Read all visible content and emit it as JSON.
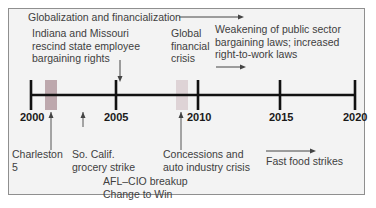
{
  "diagram": {
    "type": "timeline",
    "axis": {
      "start": 2000,
      "end": 2020,
      "ticks": [
        {
          "year": "2000"
        },
        {
          "year": "2005"
        },
        {
          "year": "2010"
        },
        {
          "year": "2015"
        },
        {
          "year": "2020"
        }
      ]
    },
    "periods": [
      {
        "label": "Globalization and financialization",
        "direction": "right-arrow"
      },
      {
        "label": "Weakening of public sector bargaining laws; increased right-to-work laws",
        "direction": "right-arrow"
      },
      {
        "label": "Fast food strikes",
        "direction": "right-arrow"
      }
    ],
    "above_events": [
      {
        "lines": [
          "Indiana and Missouri",
          "rescind state employee",
          "bargaining rights"
        ]
      },
      {
        "lines": [
          "Global",
          "financial",
          "crisis"
        ]
      },
      {
        "lines": [
          "Weakening of public sector",
          "bargaining laws; increased",
          "right-to-work laws"
        ]
      }
    ],
    "below_events": [
      {
        "lines": [
          "Charleston",
          "5"
        ]
      },
      {
        "lines": [
          "So. Calif.",
          "grocery strike"
        ]
      },
      {
        "lines": [
          "Concessions and",
          "auto industry crisis"
        ]
      },
      {
        "lines": [
          "AFL–CIO breakup",
          "Change to Win"
        ]
      },
      {
        "lines": [
          "Fast food strikes"
        ]
      }
    ],
    "top_banner": "Globalization and financialization",
    "colors": {
      "axis": "#111111",
      "shade_2001": "#b39aa0",
      "shade_2008": "#dccfd3",
      "panel_bg": "#f3f3f3",
      "panel_border": "#8f8f8f",
      "arrow": "#444444"
    }
  }
}
